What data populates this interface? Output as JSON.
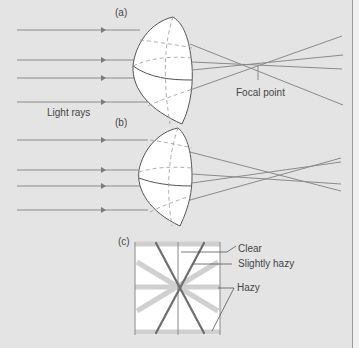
{
  "figure": {
    "panels": [
      {
        "id": "a",
        "label": "(a)",
        "description": "Lens focusing parallel light rays to a single focal point"
      },
      {
        "id": "b",
        "label": "(b)",
        "description": "Lens with aberration — rays do not converge at a single point"
      },
      {
        "id": "c",
        "label": "(c)",
        "description": "Grid pattern showing clear, slightly hazy and hazy zones"
      }
    ],
    "labels": {
      "panel_a": "(a)",
      "panel_b": "(b)",
      "panel_c": "(c)",
      "light_rays": "Light rays",
      "focal_point": "Focal point",
      "clear": "Clear",
      "slightly_hazy": "Slightly hazy",
      "hazy": "Hazy"
    },
    "colors": {
      "background": "#e4e4e4",
      "ray": "#8a8a8a",
      "lens_fill": "#ffffff",
      "lens_outline": "#555555",
      "dashed": "#999999",
      "clear_stroke": "#6e6e6e",
      "hazy_stroke": "#d0d0d0"
    }
  }
}
